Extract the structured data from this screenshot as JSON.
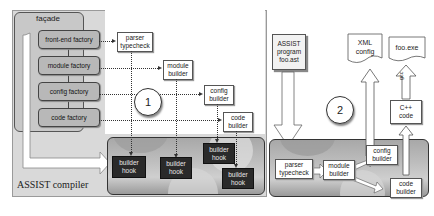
{
  "panel1": {
    "marker": "1",
    "facade_label": "façade",
    "factories": [
      {
        "label": "front-end factory"
      },
      {
        "label": "module factory"
      },
      {
        "label": "config factory"
      },
      {
        "label": "code factory"
      }
    ],
    "builders": [
      {
        "line1": "parser",
        "line2": "typecheck"
      },
      {
        "line1": "module",
        "line2": "builder"
      },
      {
        "line1": "config",
        "line2": "builder"
      },
      {
        "line1": "code",
        "line2": "builder"
      }
    ],
    "hooks": [
      {
        "line1": "builder",
        "line2": "hook"
      },
      {
        "line1": "builder",
        "line2": "hook"
      },
      {
        "line1": "builder",
        "line2": "hook"
      },
      {
        "line1": "builder",
        "line2": "hook"
      }
    ],
    "compiler_label": "ASSIST compiler"
  },
  "panel2": {
    "marker": "2",
    "source_doc": {
      "line1": "ASSIST",
      "line2": "program",
      "line3": "foo.ast"
    },
    "xml_doc": {
      "line1": "XML",
      "line2": "config"
    },
    "exe_doc": {
      "label": "foo.exe"
    },
    "gcc_label": "gcc",
    "cpp_box": {
      "line1": "C++",
      "line2": "code"
    },
    "stages": [
      {
        "line1": "parser",
        "line2": "typecheck"
      },
      {
        "line1": "module",
        "line2": "builder"
      },
      {
        "line1": "config",
        "line2": "builder"
      },
      {
        "line1": "code",
        "line2": "builder"
      }
    ]
  },
  "colors": {
    "panel_bg": "#d9d9d9",
    "factory_fill": "#b8b8b8",
    "hook_fill": "#2a2a2a",
    "gear_panel": "#bdbdbd"
  }
}
